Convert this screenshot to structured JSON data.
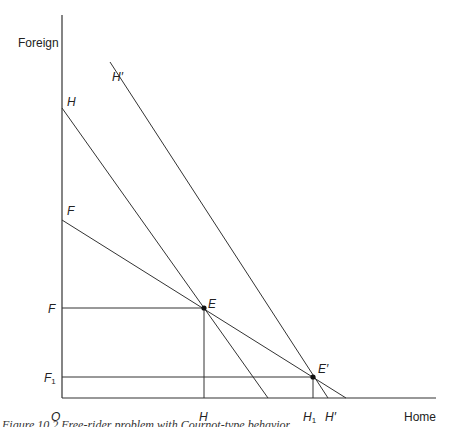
{
  "diagram": {
    "y_axis_label": "Foreign",
    "x_axis_label": "Home",
    "origin_label": "O",
    "lines": {
      "H": "H",
      "H_prime": "H′",
      "F": "F"
    },
    "points": {
      "E": "E",
      "E_prime": "E′"
    },
    "axis_ticks": {
      "F": "F",
      "F1": "F",
      "F1_sub": "1",
      "H": "H",
      "H1": "H",
      "H1_sub": "1",
      "H_prime": "H′"
    },
    "caption": "Figure 10.2  Free-rider problem with Cournot-type behavior"
  }
}
